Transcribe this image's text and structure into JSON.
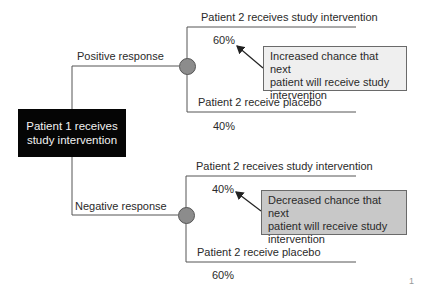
{
  "diagram": {
    "type": "decision-tree",
    "root": {
      "label": "Patient 1 receives study intervention",
      "line1": "Patient 1 receives",
      "line2": "study intervention"
    },
    "branches": [
      {
        "condition": "Positive response",
        "outcomes": [
          {
            "label": "Patient 2 receives study intervention",
            "probability": "60%"
          },
          {
            "label": "Patient 2 receive placebo",
            "probability": "40%"
          }
        ],
        "callout": {
          "line1": "Increased chance that next",
          "line2": "patient will receive study",
          "line3": "intervention"
        }
      },
      {
        "condition": "Negative response",
        "outcomes": [
          {
            "label": "Patient 2 receives study intervention",
            "probability": "40%"
          },
          {
            "label": "Patient 2 receive placebo",
            "probability": "60%"
          }
        ],
        "callout": {
          "line1": "Decreased chance that next",
          "line2": "patient will receive study",
          "line3": "intervention"
        }
      }
    ],
    "page_mark": "1"
  },
  "colors": {
    "root_fill": "#050505",
    "root_text": "#f2f2f2",
    "node_fill": "#8c8c8c",
    "callout_positive_fill": "#efefef",
    "callout_negative_fill": "#c8c8c8",
    "line": "#555555"
  }
}
